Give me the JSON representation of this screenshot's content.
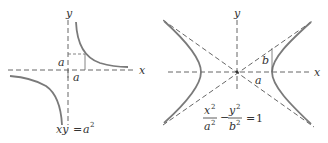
{
  "figure": {
    "top_fragment_text": "",
    "panels": [
      {
        "name": "rectangular-hyperbola",
        "axis_labels": {
          "x": "x",
          "y": "y"
        },
        "segment_labels": {
          "horizontal_a": "a",
          "vertical_a": "a"
        },
        "equation": {
          "lhs": "xy",
          "equals": "=",
          "rhs_base": "a",
          "rhs_exp": "2"
        },
        "colors": {
          "curve": "#7a7a7a",
          "axis": "#555555"
        }
      },
      {
        "name": "standard-hyperbola",
        "axis_labels": {
          "x": "x",
          "y": "y"
        },
        "segment_labels": {
          "a": "a",
          "b": "b"
        },
        "equation": {
          "frac1_num": "x",
          "frac1_num_exp": "2",
          "frac1_den": "a",
          "frac1_den_exp": "2",
          "minus": "−",
          "frac2_num": "y",
          "frac2_num_exp": "2",
          "frac2_den": "b",
          "frac2_den_exp": "2",
          "equals": "=",
          "rhs": "1"
        },
        "colors": {
          "curve": "#7a7a7a",
          "axis": "#555555"
        }
      }
    ]
  }
}
